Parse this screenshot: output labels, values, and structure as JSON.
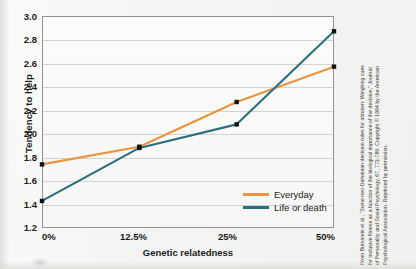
{
  "chart_data": {
    "type": "line",
    "title": "",
    "subtitle": "",
    "xlabel": "Genetic relatedness",
    "ylabel": "Tendency to help",
    "categories": [
      "0%",
      "12.5%",
      "25%",
      "50%"
    ],
    "x": [
      0,
      1,
      2,
      3
    ],
    "ylim": [
      1.2,
      3.0
    ],
    "ytick_labels": [
      "3.0",
      "2.8",
      "2.6",
      "2.4",
      "2.2",
      "2.0",
      "1.8",
      "1.6",
      "1.4",
      "1.2"
    ],
    "ytick_values": [
      3.0,
      2.8,
      2.6,
      2.4,
      2.2,
      2.0,
      1.8,
      1.6,
      1.4,
      1.2
    ],
    "grid": true,
    "legend_position": "inside-bottom-right",
    "markers": "square",
    "series": [
      {
        "name": "Everyday",
        "color": "#e8943f",
        "values": [
          1.74,
          1.89,
          2.27,
          2.57
        ]
      },
      {
        "name": "Life or death",
        "color": "#2c6e7f",
        "values": [
          1.43,
          1.88,
          2.08,
          2.87
        ]
      }
    ]
  },
  "legend": {
    "items": [
      {
        "label": "Everyday",
        "color": "#e8943f"
      },
      {
        "label": "Life or death",
        "color": "#2c6e7f"
      }
    ]
  },
  "credit": {
    "lines": [
      "From Burnstein et al., “Some neo-Darwinian decision rules for altruism: Weighing cues",
      "for inclusive fitness as a function of the biological importance of the decision,” Journal",
      "of Personality and Social Psychology, 67, 773-789. Copyright © 1994 by the American",
      "Psychological Association. Reprinted by permission."
    ]
  }
}
